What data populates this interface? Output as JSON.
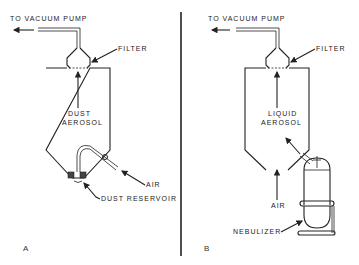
{
  "panels": {
    "a": {
      "label": "A",
      "vacuum_label": "TO VACUUM PUMP",
      "filter_label": "FILTER",
      "aerosol_line1": "DUST",
      "aerosol_line2": "AEROSOL",
      "air_label": "AIR",
      "reservoir_label": "DUST RESERVOIR"
    },
    "b": {
      "label": "B",
      "vacuum_label": "TO VACUUM PUMP",
      "filter_label": "FILTER",
      "aerosol_line1": "LIQUID",
      "aerosol_line2": "AEROSOL",
      "air_label": "AIR",
      "nebulizer_label": "NEBULIZER"
    }
  },
  "colors": {
    "ink": "#222222",
    "background": "#ffffff"
  }
}
